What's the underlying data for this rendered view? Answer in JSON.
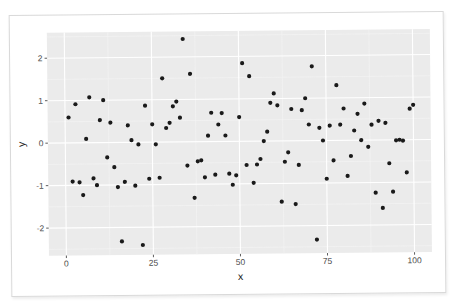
{
  "chart_data": {
    "type": "scatter",
    "title": "",
    "xlabel": "x",
    "ylabel": "y",
    "xlim": [
      -5,
      105
    ],
    "ylim": [
      -2.65,
      2.6
    ],
    "x_ticks": [
      0,
      25,
      50,
      75,
      100
    ],
    "y_ticks": [
      -2,
      -1,
      0,
      1,
      2
    ],
    "grid": true,
    "legend": null,
    "theme": {
      "panel_background": "#ebebeb",
      "grid_major": "#ffffff",
      "grid_minor": "#f5f5f5",
      "point_color": "#1a1a1a",
      "card_border": "#d9d9d9"
    },
    "points": [
      [
        1,
        0.6
      ],
      [
        2,
        -0.91
      ],
      [
        3,
        0.91
      ],
      [
        4,
        -0.93
      ],
      [
        5,
        -1.23
      ],
      [
        6,
        0.09
      ],
      [
        7,
        1.07
      ],
      [
        8,
        -0.84
      ],
      [
        9,
        -1.0
      ],
      [
        10,
        0.53
      ],
      [
        11,
        1.0
      ],
      [
        12,
        -0.35
      ],
      [
        13,
        0.47
      ],
      [
        14,
        -0.58
      ],
      [
        15,
        -1.05
      ],
      [
        16,
        -2.33
      ],
      [
        17,
        -0.93
      ],
      [
        18,
        0.4
      ],
      [
        19,
        0.05
      ],
      [
        20,
        -1.02
      ],
      [
        21,
        -0.05
      ],
      [
        22,
        -2.42
      ],
      [
        23,
        0.86
      ],
      [
        24,
        -0.86
      ],
      [
        25,
        0.42
      ],
      [
        26,
        -0.05
      ],
      [
        27,
        -0.84
      ],
      [
        28,
        1.5
      ],
      [
        29,
        0.33
      ],
      [
        30,
        0.45
      ],
      [
        31,
        0.84
      ],
      [
        32,
        0.95
      ],
      [
        33,
        0.57
      ],
      [
        34,
        2.42
      ],
      [
        35,
        -0.56
      ],
      [
        36,
        1.6
      ],
      [
        37,
        -1.32
      ],
      [
        38,
        -0.46
      ],
      [
        39,
        -0.44
      ],
      [
        40,
        -0.84
      ],
      [
        41,
        0.14
      ],
      [
        42,
        0.68
      ],
      [
        43,
        -0.78
      ],
      [
        44,
        0.4
      ],
      [
        45,
        0.67
      ],
      [
        46,
        0.14
      ],
      [
        47,
        -0.76
      ],
      [
        48,
        -1.02
      ],
      [
        49,
        -0.8
      ],
      [
        50,
        0.57
      ],
      [
        51,
        1.84
      ],
      [
        52,
        -0.56
      ],
      [
        53,
        1.53
      ],
      [
        54,
        -0.98
      ],
      [
        55,
        -0.55
      ],
      [
        56,
        -0.42
      ],
      [
        57,
        0.0
      ],
      [
        58,
        0.22
      ],
      [
        59,
        0.9
      ],
      [
        60,
        1.12
      ],
      [
        61,
        0.84
      ],
      [
        62,
        -1.43
      ],
      [
        63,
        -0.49
      ],
      [
        64,
        -0.27
      ],
      [
        65,
        0.75
      ],
      [
        66,
        -1.49
      ],
      [
        67,
        -0.57
      ],
      [
        68,
        0.72
      ],
      [
        69,
        1.0
      ],
      [
        70,
        0.38
      ],
      [
        71,
        1.75
      ],
      [
        72,
        -2.33
      ],
      [
        73,
        0.3
      ],
      [
        74,
        0.0
      ],
      [
        75,
        -0.9
      ],
      [
        76,
        0.35
      ],
      [
        77,
        -0.47
      ],
      [
        78,
        1.3
      ],
      [
        79,
        0.37
      ],
      [
        80,
        0.75
      ],
      [
        81,
        -0.84
      ],
      [
        82,
        -0.37
      ],
      [
        83,
        0.23
      ],
      [
        84,
        0.62
      ],
      [
        85,
        0.0
      ],
      [
        86,
        0.86
      ],
      [
        87,
        -0.16
      ],
      [
        88,
        0.36
      ],
      [
        89,
        -1.24
      ],
      [
        90,
        0.45
      ],
      [
        91,
        -1.6
      ],
      [
        92,
        0.4
      ],
      [
        93,
        -0.55
      ],
      [
        94,
        -1.22
      ],
      [
        95,
        -0.01
      ],
      [
        96,
        0.0
      ],
      [
        97,
        -0.02
      ],
      [
        98,
        -0.77
      ],
      [
        99,
        0.73
      ],
      [
        100,
        0.82
      ]
    ]
  }
}
